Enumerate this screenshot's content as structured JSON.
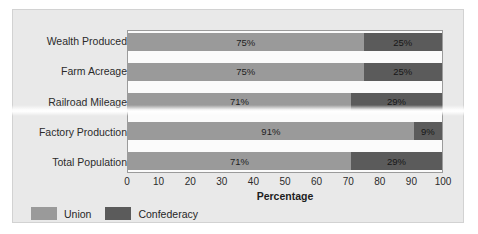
{
  "chart_data": {
    "type": "bar",
    "orientation": "horizontal",
    "stacked": true,
    "title": "",
    "xlabel": "Percentage",
    "ylabel": "",
    "xlim": [
      0,
      100
    ],
    "xticks": [
      0,
      10,
      20,
      30,
      40,
      50,
      60,
      70,
      80,
      90,
      100
    ],
    "grid": false,
    "legend_position": "bottom-left",
    "categories": [
      "Wealth Produced",
      "Farm Acreage",
      "Railroad Mileage",
      "Factory Production",
      "Total Population"
    ],
    "series": [
      {
        "name": "Union",
        "color": "#9a9a9a",
        "values": [
          75,
          75,
          71,
          91,
          71
        ],
        "labels": [
          "75%",
          "75%",
          "71%",
          "91%",
          "71%"
        ]
      },
      {
        "name": "Confederacy",
        "color": "#5b5b5b",
        "values": [
          25,
          25,
          29,
          9,
          29
        ],
        "labels": [
          "25%",
          "25%",
          "29%",
          "9%",
          "29%"
        ]
      }
    ]
  },
  "legend": {
    "items": [
      {
        "label": "Union",
        "color": "#9a9a9a"
      },
      {
        "label": "Confederacy",
        "color": "#5b5b5b"
      }
    ]
  },
  "colors": {
    "figure_background": "#e9e9e9",
    "plot_background": "#fbfbfb",
    "plot_border": "#9b9b9b",
    "text": "#2b2b2b"
  }
}
